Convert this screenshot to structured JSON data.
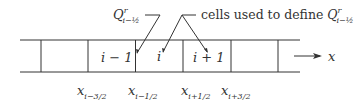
{
  "annotation_label": "cells used to define",
  "flux_label": {
    "base": "Q",
    "superscript": "r",
    "subscript": "i−½"
  },
  "cells": [
    {
      "id": "i-minus-1",
      "label": "i − 1"
    },
    {
      "id": "i",
      "label": "i"
    },
    {
      "id": "i-plus-1",
      "label": "i + 1"
    }
  ],
  "axis_label": "x",
  "interfaces": [
    {
      "label": "x",
      "subscript": "i−3/2"
    },
    {
      "label": "x",
      "subscript": "i−1/2"
    },
    {
      "label": "x",
      "subscript": "i+1/2"
    },
    {
      "label": "x",
      "subscript": "i+3/2"
    }
  ],
  "colors": {
    "line": "#333333",
    "background": "#ffffff"
  }
}
